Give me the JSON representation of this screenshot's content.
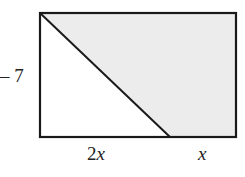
{
  "diagram": {
    "rectangle": {
      "x": 40,
      "y": 13,
      "width": 196,
      "height": 124
    },
    "diagonal": {
      "from": [
        40,
        13
      ],
      "to": [
        170,
        137
      ]
    },
    "colors": {
      "stroke": "#1a1a1a",
      "shaded_fill": "#ececec",
      "background": "#ffffff"
    },
    "labels": {
      "left_side": "– 7",
      "bottom_left_segment": "2x",
      "bottom_left_coef": "2",
      "bottom_left_var": "x",
      "bottom_right_segment": "x",
      "bottom_right_var": "x"
    }
  }
}
